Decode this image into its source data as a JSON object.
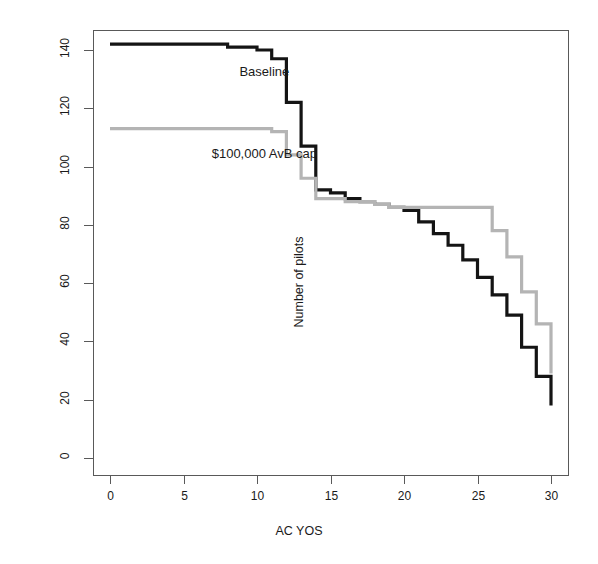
{
  "chart_data": {
    "type": "line",
    "title": "",
    "xlabel": "AC YOS",
    "ylabel": "Number of pilots",
    "xlim": [
      0,
      30
    ],
    "ylim": [
      0,
      148
    ],
    "xticks": [
      0,
      5,
      10,
      15,
      20,
      25,
      30
    ],
    "yticks": [
      0,
      20,
      40,
      60,
      80,
      100,
      120,
      140
    ],
    "grid": false,
    "legend": "inline-annotations",
    "step_style": "hv",
    "x": [
      0,
      1,
      2,
      3,
      4,
      5,
      6,
      7,
      8,
      9,
      10,
      11,
      12,
      13,
      14,
      15,
      16,
      17,
      18,
      19,
      20,
      21,
      22,
      23,
      24,
      25,
      26,
      27,
      28,
      29,
      30
    ],
    "series": [
      {
        "name": "Baseline",
        "color": "#141414",
        "label_x": 10.5,
        "label_y": 132,
        "values": [
          142,
          142,
          142,
          142,
          142,
          142,
          142,
          142,
          141,
          141,
          140,
          137,
          122,
          107,
          92,
          91,
          89,
          88,
          87,
          86,
          85,
          81,
          77,
          73,
          68,
          62,
          56,
          49,
          38,
          28,
          18
        ]
      },
      {
        "name": "$100,000 AvB cap",
        "color": "#b4b4b4",
        "label_x": 10.5,
        "label_y": 104,
        "values": [
          113,
          113,
          113,
          113,
          113,
          113,
          113,
          113,
          113,
          113,
          113,
          112,
          104,
          96,
          89,
          89,
          88,
          88,
          87,
          86,
          86,
          86,
          86,
          86,
          86,
          86,
          78,
          69,
          57,
          46,
          29
        ]
      }
    ]
  },
  "axes": {
    "x_title": "AC YOS",
    "y_title": "Number of pilots",
    "x_tick_labels": [
      "0",
      "5",
      "10",
      "15",
      "20",
      "25",
      "30"
    ],
    "y_tick_labels": [
      "0",
      "20",
      "40",
      "60",
      "80",
      "100",
      "120",
      "140"
    ]
  },
  "annotations": {
    "baseline_label": "Baseline",
    "cap_label": "$100,000 AvB cap"
  },
  "colors": {
    "baseline": "#141414",
    "cap": "#b4b4b4",
    "axis": "#595959",
    "background": "#ffffff"
  },
  "plot_box": {
    "left": 93,
    "right": 568,
    "top": 30,
    "bottom": 475
  }
}
